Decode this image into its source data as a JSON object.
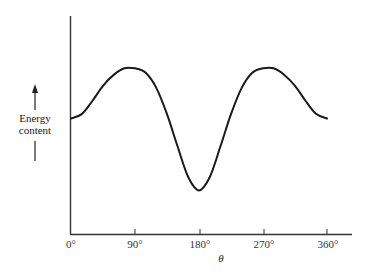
{
  "chart_data": {
    "type": "line",
    "title": "",
    "xlabel": "θ",
    "ylabel_lines": [
      "Energy",
      "content"
    ],
    "ylabel": "Energy content",
    "x_ticks": [
      0,
      90,
      180,
      270,
      360
    ],
    "x_tick_labels": [
      "0°",
      "90°",
      "180°",
      "270°",
      "360°"
    ],
    "xlim": [
      0,
      375
    ],
    "ylim": [
      0,
      10
    ],
    "y_ticks_shown": false,
    "grid": false,
    "legend": null,
    "series": [
      {
        "name": "Energy content vs θ",
        "x": [
          0,
          15,
          30,
          45,
          60,
          75,
          90,
          105,
          120,
          135,
          150,
          165,
          180,
          195,
          210,
          225,
          240,
          255,
          270,
          285,
          300,
          315,
          330,
          345,
          360
        ],
        "y": [
          5.3,
          5.5,
          6.1,
          6.8,
          7.3,
          7.6,
          7.6,
          7.4,
          6.7,
          5.5,
          4.0,
          2.6,
          2.0,
          2.6,
          4.0,
          5.5,
          6.7,
          7.4,
          7.6,
          7.6,
          7.3,
          6.8,
          6.1,
          5.5,
          5.3
        ]
      }
    ],
    "annotations": [
      "arrow pointing up alongside y-axis label indicating increasing energy"
    ]
  },
  "axes": {
    "x_label": "θ",
    "y_label_line1": "Energy",
    "y_label_line2": "content",
    "tick_0": "0°",
    "tick_90": "90°",
    "tick_180": "180°",
    "tick_270": "270°",
    "tick_360": "360°"
  },
  "colors": {
    "line": "#1a1a1a",
    "axis": "#333333",
    "background": "#ffffff"
  }
}
